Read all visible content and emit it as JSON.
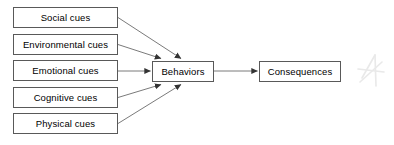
{
  "diagram": {
    "type": "flowchart",
    "title": "",
    "background_color": "#ffffff",
    "box_border_color": "#595959",
    "text_color": "#000000",
    "arrow_color": "#404040",
    "inputs": [
      {
        "id": "social",
        "label": "Social cues"
      },
      {
        "id": "environmental",
        "label": "Environmental cues"
      },
      {
        "id": "emotional",
        "label": "Emotional cues"
      },
      {
        "id": "cognitive",
        "label": "Cognitive cues"
      },
      {
        "id": "physical",
        "label": "Physical cues"
      }
    ],
    "behaviors": {
      "id": "behaviors",
      "label": "Behaviors"
    },
    "consequences": {
      "id": "consequences",
      "label": "Consequences"
    },
    "edges": [
      {
        "from": "social",
        "to": "behaviors",
        "arrowhead": "target"
      },
      {
        "from": "environmental",
        "to": "behaviors",
        "arrowhead": "target"
      },
      {
        "from": "emotional",
        "to": "behaviors",
        "arrowhead": "target"
      },
      {
        "from": "cognitive",
        "to": "behaviors",
        "arrowhead": "target"
      },
      {
        "from": "physical",
        "to": "behaviors",
        "arrowhead": "target"
      },
      {
        "from": "behaviors",
        "to": "consequences",
        "arrowhead": "target"
      }
    ],
    "watermark": {
      "shape": "stylized-a-star",
      "color": "#d9d9d9"
    }
  }
}
